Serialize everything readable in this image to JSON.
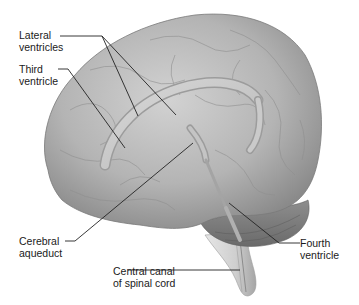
{
  "figure": {
    "labels": [
      {
        "id": "lateral-ventricles",
        "text": "Lateral\nventricles"
      },
      {
        "id": "third-ventricle",
        "text": "Third\nventricle"
      },
      {
        "id": "cerebral-aqueduct",
        "text": "Cerebral\naqueduct"
      },
      {
        "id": "central-canal",
        "text": "Central canal\nof spinal cord"
      },
      {
        "id": "fourth-ventricle",
        "text": "Fourth\nventricle"
      }
    ],
    "colors": {
      "background": "#ffffff",
      "brain_light": "#c9c9c9",
      "brain_mid": "#a8a8a8",
      "brain_dark": "#7d7d7d",
      "leader_line": "#222222",
      "text": "#1a1a1a"
    }
  }
}
